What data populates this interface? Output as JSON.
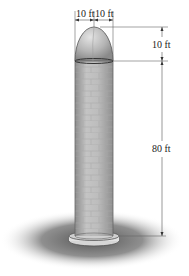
{
  "diagram": {
    "dimensions": {
      "top_left": "10 ft",
      "top_right": "10 ft",
      "dome_height": "10 ft",
      "cylinder_height": "80 ft"
    },
    "colors": {
      "silo_fill": "#b8b8b8",
      "silo_dark": "#8a8a8a",
      "dome_light": "#d8d8d8",
      "shadow": "#5a5a5a",
      "dimension_line": "#555555"
    }
  }
}
